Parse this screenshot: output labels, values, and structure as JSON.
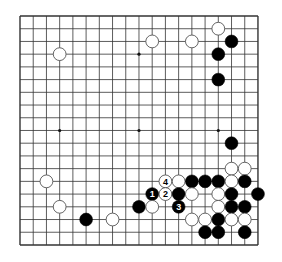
{
  "board": {
    "size": 19,
    "origin_x": 20,
    "origin_y": 16,
    "spacing_x": 13.22,
    "spacing_y": 12.72,
    "line_color": "#333333",
    "background": "#ffffff",
    "star_points": [
      [
        3,
        3
      ],
      [
        9,
        3
      ],
      [
        15,
        3
      ],
      [
        3,
        9
      ],
      [
        9,
        9
      ],
      [
        15,
        9
      ],
      [
        3,
        15
      ],
      [
        9,
        15
      ],
      [
        15,
        15
      ]
    ],
    "stones": [
      {
        "color": "white",
        "col": 15,
        "row": 1
      },
      {
        "color": "white",
        "col": 3,
        "row": 3
      },
      {
        "color": "white",
        "col": 10,
        "row": 2
      },
      {
        "color": "white",
        "col": 13,
        "row": 2
      },
      {
        "color": "black",
        "col": 16,
        "row": 2
      },
      {
        "color": "black",
        "col": 15,
        "row": 3
      },
      {
        "color": "black",
        "col": 15,
        "row": 5
      },
      {
        "color": "black",
        "col": 16,
        "row": 10
      },
      {
        "color": "white",
        "col": 16,
        "row": 12
      },
      {
        "color": "white",
        "col": 17,
        "row": 12
      },
      {
        "color": "white",
        "col": 2,
        "row": 13
      },
      {
        "color": "white",
        "col": 11,
        "row": 13,
        "label": "4"
      },
      {
        "color": "white",
        "col": 12,
        "row": 13
      },
      {
        "color": "black",
        "col": 13,
        "row": 13
      },
      {
        "color": "black",
        "col": 14,
        "row": 13
      },
      {
        "color": "black",
        "col": 15,
        "row": 13
      },
      {
        "color": "white",
        "col": 16,
        "row": 13
      },
      {
        "color": "black",
        "col": 17,
        "row": 13
      },
      {
        "color": "black",
        "col": 10,
        "row": 14,
        "label": "1"
      },
      {
        "color": "white",
        "col": 11,
        "row": 14,
        "label": "2"
      },
      {
        "color": "black",
        "col": 12,
        "row": 14
      },
      {
        "color": "white",
        "col": 13,
        "row": 14
      },
      {
        "color": "white",
        "col": 15,
        "row": 14
      },
      {
        "color": "black",
        "col": 16,
        "row": 14
      },
      {
        "color": "black",
        "col": 18,
        "row": 14
      },
      {
        "color": "white",
        "col": 3,
        "row": 15
      },
      {
        "color": "black",
        "col": 9,
        "row": 15
      },
      {
        "color": "white",
        "col": 10,
        "row": 15
      },
      {
        "color": "black",
        "col": 12,
        "row": 15,
        "label": "3"
      },
      {
        "color": "white",
        "col": 15,
        "row": 15
      },
      {
        "color": "black",
        "col": 16,
        "row": 15
      },
      {
        "color": "black",
        "col": 17,
        "row": 15
      },
      {
        "color": "black",
        "col": 5,
        "row": 16
      },
      {
        "color": "white",
        "col": 7,
        "row": 16
      },
      {
        "color": "white",
        "col": 13,
        "row": 16
      },
      {
        "color": "white",
        "col": 14,
        "row": 16
      },
      {
        "color": "black",
        "col": 15,
        "row": 16
      },
      {
        "color": "white",
        "col": 16,
        "row": 16
      },
      {
        "color": "white",
        "col": 17,
        "row": 16
      },
      {
        "color": "black",
        "col": 14,
        "row": 17
      },
      {
        "color": "black",
        "col": 15,
        "row": 17
      },
      {
        "color": "black",
        "col": 17,
        "row": 17
      }
    ]
  }
}
